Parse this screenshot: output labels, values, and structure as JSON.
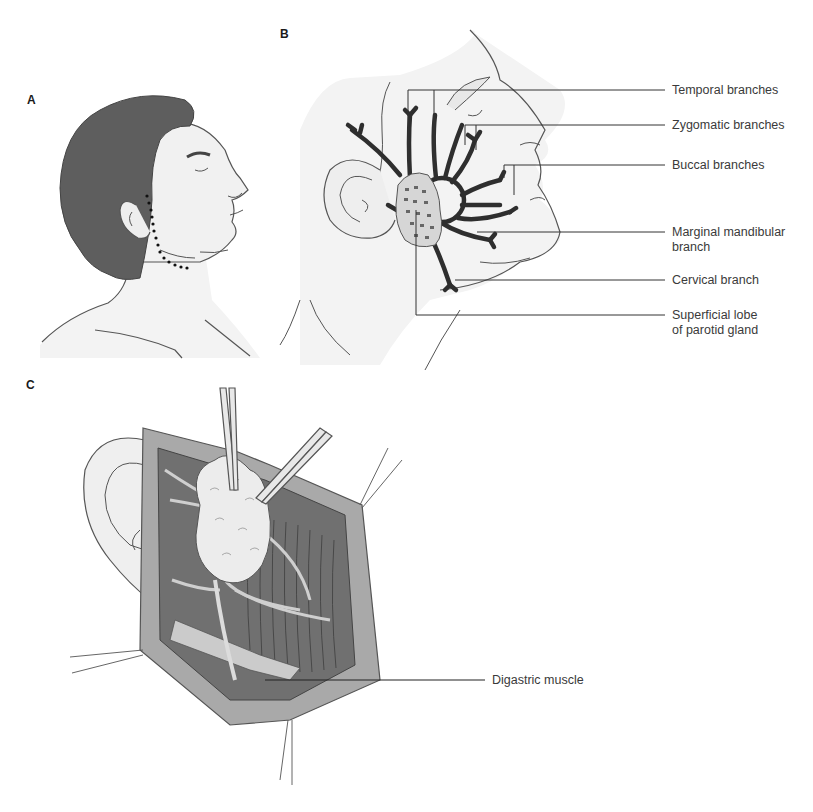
{
  "figure": {
    "panels": [
      {
        "id": "A",
        "letter": "A",
        "description": "Profile of head with dotted preauricular-cervical incision line"
      },
      {
        "id": "B",
        "letter": "B",
        "description": "Facial nerve branches fanning across superficial lobe of parotid gland"
      },
      {
        "id": "C",
        "letter": "C",
        "description": "Surgical field with retracted skin flaps, parotid gland elevated by forceps"
      }
    ],
    "labels_B": [
      {
        "id": "temporal",
        "text": "Temporal branches"
      },
      {
        "id": "zygomatic",
        "text": "Zygomatic branches"
      },
      {
        "id": "buccal",
        "text": "Buccal branches"
      },
      {
        "id": "marginal",
        "line1": "Marginal mandibular",
        "line2": "branch"
      },
      {
        "id": "cervical",
        "text": "Cervical branch"
      },
      {
        "id": "parotid",
        "line1": "Superficial lobe",
        "line2": "of parotid gland"
      }
    ],
    "labels_C": [
      {
        "id": "digastric",
        "text": "Digastric muscle"
      }
    ]
  },
  "colors": {
    "hair": "#5e5e5e",
    "skin": "#f1f1f1",
    "outline": "#555555",
    "nerve": "#2e2e2e",
    "gland": "#d9d9d9",
    "field_dark": "#6f6f6f",
    "flap": "#a8a8a8",
    "leader": "#333333"
  }
}
